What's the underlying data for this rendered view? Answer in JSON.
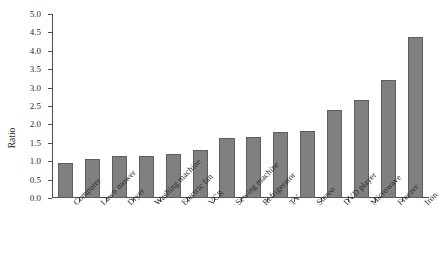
{
  "chart_data": {
    "type": "bar",
    "title": "",
    "xlabel": "",
    "ylabel": "Ratio",
    "ylim": [
      0.0,
      5.0
    ],
    "ytick_labels": [
      "0.0",
      "0.5",
      "1.0",
      "1.5",
      "2.0",
      "2.5",
      "3.0",
      "3.5",
      "4.0",
      "4.5",
      "5.0"
    ],
    "ytick_values": [
      0.0,
      0.5,
      1.0,
      1.5,
      2.0,
      2.5,
      3.0,
      3.5,
      4.0,
      4.5,
      5.0
    ],
    "grid": false,
    "legend": false,
    "bar_color": "#808080",
    "bar_edge_color": "#5e5e5e",
    "axis_color": "#4d4d4d",
    "categories": [
      "Computer",
      "Lawn mower",
      "Dryer",
      "Washing machine",
      "Electric fan",
      "VCR",
      "Sewing machine",
      "Refrigerator",
      "TV",
      "Stereo",
      "DVD player",
      "Microwave",
      "Freezer",
      "Iron"
    ],
    "values": [
      0.95,
      1.05,
      1.13,
      1.15,
      1.2,
      1.3,
      1.62,
      1.65,
      1.8,
      1.81,
      2.38,
      2.67,
      3.2,
      4.37
    ]
  }
}
